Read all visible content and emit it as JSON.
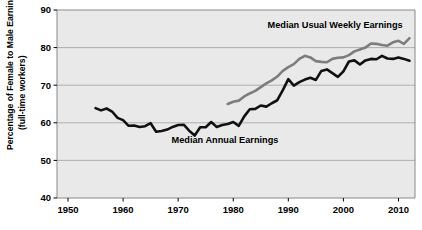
{
  "chart_data": {
    "type": "line",
    "title": "",
    "xlabel": "",
    "ylabel": "Percentage of Female to Male Earnings (full-time workers)",
    "ylabel_line1": "Percentage of Female to Male Earnings",
    "ylabel_line2": "(full-time workers)",
    "xlim": [
      1948,
      2013
    ],
    "ylim": [
      40,
      90
    ],
    "xticks": [
      1950,
      1960,
      1970,
      1980,
      1990,
      2000,
      2010
    ],
    "xtick_labels": [
      "1950",
      "1960",
      "1970",
      "1980",
      "1990",
      "2000",
      "2010"
    ],
    "yticks": [
      40,
      50,
      60,
      70,
      80,
      90
    ],
    "ytick_labels": [
      "40",
      "50",
      "60",
      "70",
      "80",
      "90"
    ],
    "grid": "horizontal",
    "legend_position": "inline-annotation",
    "plot_background": "#e9e9e9",
    "grid_color": "#a8a8a8",
    "border_color": "#888888",
    "series": [
      {
        "name": "Median Annual Earnings",
        "color": "#111111",
        "width": 2.6,
        "annotation": "Median Annual Earnings",
        "annotation_x": 1978.5,
        "annotation_y": 54.5,
        "x": [
          1955,
          1956,
          1957,
          1958,
          1959,
          1960,
          1961,
          1962,
          1963,
          1964,
          1965,
          1966,
          1967,
          1968,
          1969,
          1970,
          1971,
          1972,
          1973,
          1974,
          1975,
          1976,
          1977,
          1978,
          1979,
          1980,
          1981,
          1982,
          1983,
          1984,
          1985,
          1986,
          1987,
          1988,
          1989,
          1990,
          1991,
          1992,
          1993,
          1994,
          1995,
          1996,
          1997,
          1998,
          1999,
          2000,
          2001,
          2002,
          2003,
          2004,
          2005,
          2006,
          2007,
          2008,
          2009,
          2010,
          2011,
          2012
        ],
        "y": [
          63.9,
          63.3,
          63.8,
          63.0,
          61.3,
          60.7,
          59.2,
          59.3,
          58.9,
          59.1,
          59.9,
          57.6,
          57.8,
          58.2,
          58.9,
          59.4,
          59.5,
          57.9,
          56.6,
          58.8,
          58.8,
          60.2,
          58.9,
          59.4,
          59.7,
          60.2,
          59.2,
          61.7,
          63.6,
          63.7,
          64.6,
          64.3,
          65.2,
          66.0,
          68.7,
          71.6,
          69.9,
          70.8,
          71.5,
          72.0,
          71.4,
          73.8,
          74.2,
          73.2,
          72.2,
          73.7,
          76.3,
          76.6,
          75.5,
          76.6,
          77.0,
          76.9,
          77.8,
          77.1,
          77.0,
          77.4,
          77.0,
          76.5
        ]
      },
      {
        "name": "Median Usual Weekly Earnings",
        "color": "#7d7d7d",
        "width": 2.6,
        "annotation": "Median Usual Weekly Earnings",
        "annotation_x": 1998.5,
        "annotation_y": 85.2,
        "x": [
          1979,
          1980,
          1981,
          1982,
          1983,
          1984,
          1985,
          1986,
          1987,
          1988,
          1989,
          1990,
          1991,
          1992,
          1993,
          1994,
          1995,
          1996,
          1997,
          1998,
          1999,
          2000,
          2001,
          2002,
          2003,
          2004,
          2005,
          2006,
          2007,
          2008,
          2009,
          2010,
          2011,
          2012
        ],
        "y": [
          65.0,
          65.6,
          65.9,
          67.0,
          67.8,
          68.5,
          69.5,
          70.5,
          71.3,
          72.3,
          73.8,
          74.8,
          75.6,
          77.0,
          77.8,
          77.4,
          76.4,
          76.2,
          76.1,
          77.0,
          77.3,
          77.4,
          78.0,
          79.0,
          79.5,
          80.0,
          81.1,
          81.0,
          80.7,
          80.5,
          81.4,
          81.8,
          81.0,
          82.5
        ]
      }
    ]
  },
  "plot_geometry": {
    "left": 57,
    "right": 415,
    "top": 10,
    "bottom": 198
  }
}
